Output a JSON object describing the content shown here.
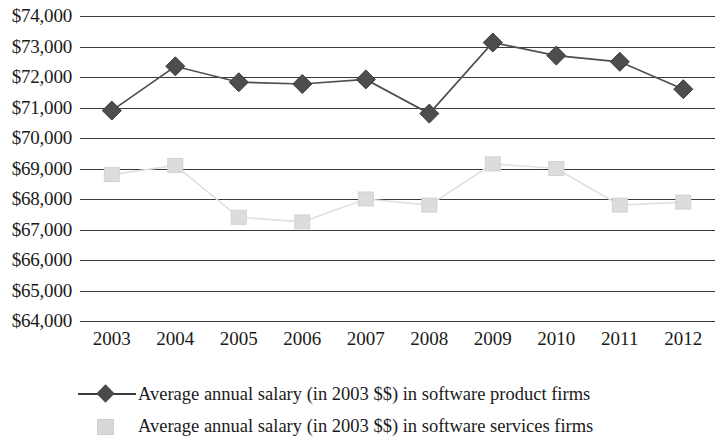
{
  "chart_data": {
    "type": "line",
    "title": "",
    "xlabel": "",
    "ylabel": "",
    "categories": [
      "2003",
      "2004",
      "2005",
      "2006",
      "2007",
      "2008",
      "2009",
      "2010",
      "2011",
      "2012"
    ],
    "ylim": [
      64000,
      74000
    ],
    "ytick_step": 1000,
    "ytick_labels": [
      "$74,000",
      "$73,000",
      "$72,000",
      "$71,000",
      "$70,000",
      "$69,000",
      "$68,000",
      "$67,000",
      "$66,000",
      "$65,000",
      "$64,000"
    ],
    "ytick_values": [
      74000,
      73000,
      72000,
      71000,
      70000,
      69000,
      68000,
      67000,
      66000,
      65000,
      64000
    ],
    "grid": true,
    "legend_position": "bottom",
    "series": [
      {
        "name": "Average annual salary (in 2003 $$) in software product firms",
        "marker": "diamond",
        "color": "#4a4a4a",
        "values": [
          70900,
          72350,
          71830,
          71770,
          71920,
          70800,
          73130,
          72700,
          72500,
          71600
        ]
      },
      {
        "name": "Average annual salary (in 2003 $$) in software services firms",
        "marker": "square",
        "color": "#d8d8d8",
        "values": [
          68800,
          69100,
          67400,
          67250,
          68000,
          67800,
          69150,
          69000,
          67800,
          67900
        ]
      }
    ]
  },
  "legend": {
    "items": [
      {
        "label": "Average annual salary (in 2003 $$) in software product firms",
        "key": "line-diamond-marker"
      },
      {
        "label": "Average annual salary (in 2003 $$) in software services firms",
        "key": "square-marker"
      }
    ]
  }
}
